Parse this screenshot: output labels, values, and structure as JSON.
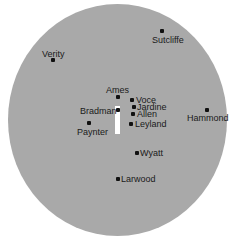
{
  "diagram": {
    "type": "cricket-field-placement",
    "field_color": "#a9a9a9",
    "pitch_color": "#ffffff",
    "fielders": [
      {
        "name": "Sutcliffe",
        "dot": [
          160,
          29
        ],
        "label": [
          152,
          35
        ]
      },
      {
        "name": "Verity",
        "dot": [
          51,
          58
        ],
        "label": [
          42,
          49
        ]
      },
      {
        "name": "Ames",
        "dot": [
          116,
          95
        ],
        "label": [
          106,
          85
        ]
      },
      {
        "name": "Voce",
        "dot": [
          130,
          98
        ],
        "label": [
          136,
          95
        ]
      },
      {
        "name": "Jardine",
        "dot": [
          132,
          105
        ],
        "label": [
          137,
          102
        ]
      },
      {
        "name": "Allen",
        "dot": [
          131,
          112
        ],
        "label": [
          137,
          109
        ]
      },
      {
        "name": "Leyland",
        "dot": [
          129,
          122
        ],
        "label": [
          135,
          119
        ]
      },
      {
        "name": "Bradman",
        "dot": [
          116,
          108
        ],
        "label": [
          80,
          106
        ]
      },
      {
        "name": "Paynter",
        "dot": [
          87,
          121
        ],
        "label": [
          77,
          127
        ]
      },
      {
        "name": "Hammond",
        "dot": [
          205,
          108
        ],
        "label": [
          187,
          113
        ]
      },
      {
        "name": "Wyatt",
        "dot": [
          135,
          151
        ],
        "label": [
          140,
          148
        ]
      },
      {
        "name": "Larwood",
        "dot": [
          116,
          177
        ],
        "label": [
          121,
          174
        ]
      }
    ]
  }
}
